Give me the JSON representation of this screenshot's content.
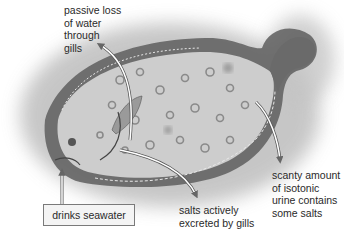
{
  "figure": {
    "colors": {
      "background": "#ffffff",
      "halo": "#b9b9b9",
      "body": "#cfcfcf",
      "fin_edge": "#4a4a4a",
      "spots": "#8a8a8a",
      "text": "#2a2a2a",
      "arrow_outline": "#555555",
      "arrow_fill": "#ffffff"
    }
  },
  "labels": {
    "gills_water_loss": "passive loss\nof water\nthrough\ngills",
    "urine": "scanty amount\nof isotonic\nurine contains\nsome salts",
    "salts_excreted": "salts actively\nexcreted by gills",
    "drinks": "drinks seawater"
  }
}
